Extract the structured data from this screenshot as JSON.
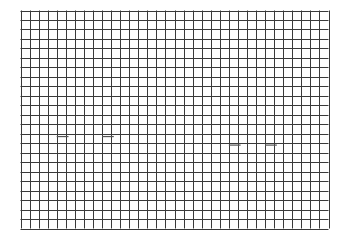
{
  "grid": {
    "columns": 34,
    "rows": 23,
    "line_color": "#3a3a3a",
    "background": "#ffffff"
  },
  "marks": [
    {
      "name": "dash-left-1",
      "col": 4,
      "row": 13.3
    },
    {
      "name": "dash-left-2",
      "col": 9,
      "row": 13.3
    },
    {
      "name": "dash-right-1",
      "col": 23,
      "row": 14.2
    },
    {
      "name": "dash-right-2",
      "col": 27,
      "row": 14.2
    }
  ]
}
